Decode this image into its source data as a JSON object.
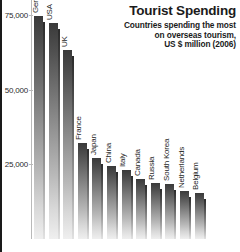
{
  "chart_data": {
    "type": "bar",
    "title": "Tourist Spending",
    "subtitle_lines": [
      "Countries spending the most",
      "on overseas tourism,",
      "US $ million (2006)"
    ],
    "xlabel": "",
    "ylabel": "",
    "ylim": [
      0,
      80000
    ],
    "grid": false,
    "legend": null,
    "ytick_labels": [
      "75,000",
      "50,000",
      "25,000"
    ],
    "yticks": [
      75000,
      50000,
      25000
    ],
    "categories": [
      "Germany",
      "USA",
      "UK",
      "France",
      "Japan",
      "China",
      "Italy",
      "Canada",
      "Russia",
      "South Korea",
      "Netherlands",
      "Belgium"
    ],
    "values": [
      74800,
      72400,
      63400,
      32200,
      27000,
      24400,
      23200,
      20000,
      18800,
      18400,
      16200,
      15400
    ],
    "bar_color_top": "#3a3a3a",
    "bar_color_bottom": "#efefef"
  }
}
